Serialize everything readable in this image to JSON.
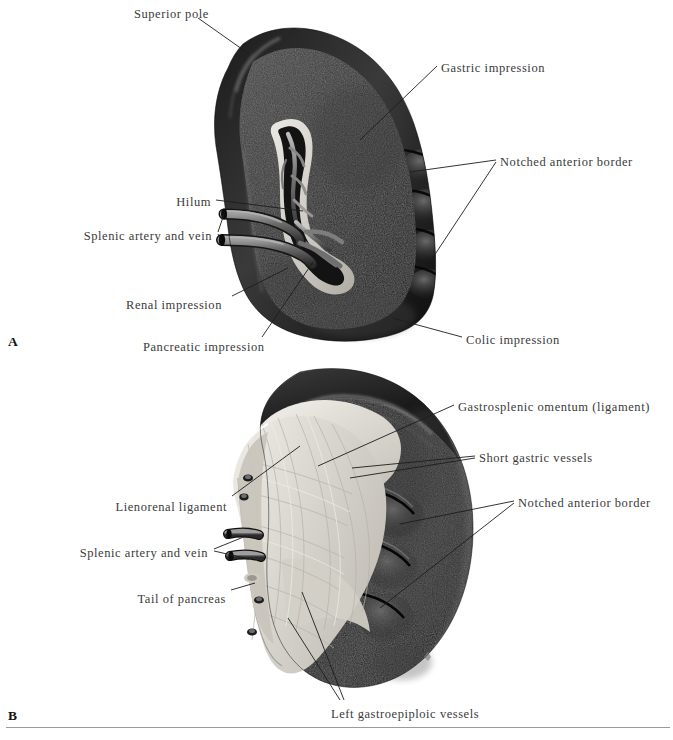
{
  "figure": {
    "title_text": "",
    "background_color": "#ffffff",
    "spleen_color": "#171717",
    "spleen_mid_color": "#2e2e2e",
    "highlight_color": "#8f8f8f",
    "ligament_color": "#e3e0da",
    "vessel_color": "#6f6f6f",
    "rule_color": "#9a9a9a",
    "label_color": "#3a3a3a"
  },
  "panels": [
    {
      "letter": "A",
      "letter_x": 8,
      "letter_y": 334,
      "labels": [
        {
          "name": "superior-pole",
          "text": "Superior pole",
          "x": 134,
          "y": 8,
          "align": "left"
        },
        {
          "name": "gastric-impression",
          "text": "Gastric impression",
          "x": 441,
          "y": 62,
          "align": "left"
        },
        {
          "name": "notched-anterior-border",
          "text": "Notched anterior border",
          "x": 500,
          "y": 156,
          "align": "left"
        },
        {
          "name": "hilum",
          "text": "Hilum",
          "x": 211,
          "y": 196,
          "align": "right"
        },
        {
          "name": "splenic-artery-and-vein",
          "text": "Splenic artery and vein",
          "x": 212,
          "y": 230,
          "align": "right"
        },
        {
          "name": "renal-impression",
          "text": "Renal impression",
          "x": 126,
          "y": 299,
          "align": "left"
        },
        {
          "name": "pancreatic-impression",
          "text": "Pancreatic impression",
          "x": 143,
          "y": 341,
          "align": "left"
        },
        {
          "name": "colic-impression",
          "text": "Colic impression",
          "x": 466,
          "y": 334,
          "align": "left"
        }
      ]
    },
    {
      "letter": "B",
      "letter_x": 8,
      "letter_y": 708,
      "labels": [
        {
          "name": "gastrosplenic-omentum",
          "text": "Gastrosplenic omentum (ligament)",
          "x": 458,
          "y": 401,
          "align": "left"
        },
        {
          "name": "short-gastric-vessels",
          "text": "Short gastric vessels",
          "x": 479,
          "y": 452,
          "align": "left"
        },
        {
          "name": "notched-anterior-border-b",
          "text": "Notched anterior border",
          "x": 518,
          "y": 497,
          "align": "left"
        },
        {
          "name": "lienorenal-ligament",
          "text": "Lienorenal ligament",
          "x": 227,
          "y": 501,
          "align": "right"
        },
        {
          "name": "splenic-artery-and-vein-b",
          "text": "Splenic artery and vein",
          "x": 208,
          "y": 547,
          "align": "right"
        },
        {
          "name": "tail-of-pancreas",
          "text": "Tail of pancreas",
          "x": 226,
          "y": 593,
          "align": "right"
        },
        {
          "name": "left-gastroepiploic-vessels",
          "text": "Left gastroepiploic vessels",
          "x": 331,
          "y": 708,
          "align": "left"
        }
      ]
    }
  ],
  "footer": {
    "rule_y": 727
  }
}
